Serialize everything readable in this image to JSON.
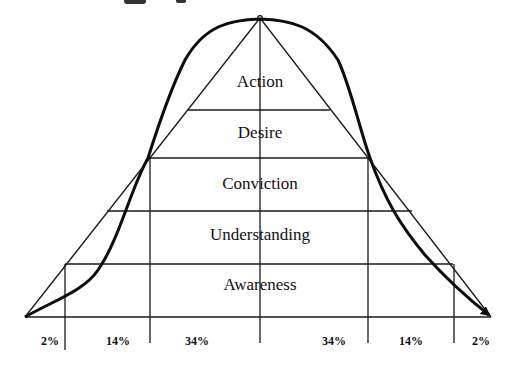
{
  "diagram": {
    "type": "bell-curve-adoption-pyramid",
    "stages_top_to_bottom": [
      {
        "label": "Action"
      },
      {
        "label": "Desire"
      },
      {
        "label": "Conviction"
      },
      {
        "label": "Understanding"
      },
      {
        "label": "Awareness"
      }
    ],
    "distribution_segments_left_to_right": [
      {
        "label": "2%",
        "value": 2
      },
      {
        "label": "14%",
        "value": 14
      },
      {
        "label": "34%",
        "value": 34
      },
      {
        "label": "34%",
        "value": 34
      },
      {
        "label": "14%",
        "value": 14
      },
      {
        "label": "2%",
        "value": 2
      }
    ],
    "curve_end_marker": "arrowhead",
    "colors": {
      "ink": "#111111",
      "background": "#ffffff"
    }
  }
}
